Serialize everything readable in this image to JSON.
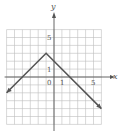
{
  "chart_data": {
    "type": "line",
    "title": "",
    "xlabel": "x",
    "ylabel": "y",
    "xlim": [
      -6,
      6
    ],
    "ylim": [
      -6,
      6
    ],
    "grid": true,
    "grid_step": 1,
    "tick_labels": {
      "x": [
        {
          "value": 1,
          "label": "1"
        },
        {
          "value": 5,
          "label": "5"
        }
      ],
      "y": [
        {
          "value": 1,
          "label": "1"
        },
        {
          "value": 5,
          "label": "5"
        }
      ],
      "origin": "0"
    },
    "series": [
      {
        "name": "f(x) = -|x + 1| + 3",
        "x": [
          -6,
          -1,
          6
        ],
        "y": [
          -2,
          3,
          -4
        ],
        "arrows_at_ends": true
      }
    ],
    "legend": null
  },
  "colors": {
    "grid": "#bdbdbd",
    "axis": "#555555",
    "line": "#555555",
    "background": "#ffffff"
  }
}
